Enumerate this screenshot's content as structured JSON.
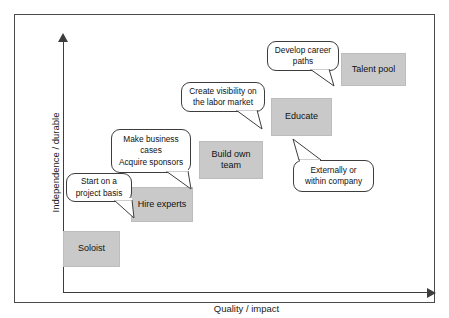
{
  "diagram": {
    "axes": {
      "y_label": "Independence / durable",
      "x_label": "Quality / impact"
    },
    "colors": {
      "box_fill": "#c9c9c9",
      "box_border": "#bdbdbd",
      "line": "#3d3d3d",
      "frame": "#4a4a4a",
      "text": "#111111",
      "background": "#ffffff"
    },
    "stages": [
      {
        "id": "soloist",
        "label": "Soloist"
      },
      {
        "id": "hire-experts",
        "label": "Hire experts"
      },
      {
        "id": "build-own-team",
        "label": "Build own\nteam"
      },
      {
        "id": "educate",
        "label": "Educate"
      },
      {
        "id": "talent-pool",
        "label": "Talent pool"
      }
    ],
    "callouts": [
      {
        "id": "start-on-a-project-basis",
        "label": "Start on a\nproject basis",
        "points_to": "hire-experts"
      },
      {
        "id": "make-business-cases",
        "label": "Make business\ncases\nAcquire sponsors",
        "points_to": "build-own-team"
      },
      {
        "id": "create-visibility",
        "label": "Create visibility on\nthe labor market",
        "points_to": "educate"
      },
      {
        "id": "develop-career-paths",
        "label": "Develop career\npaths",
        "points_to": "talent-pool"
      },
      {
        "id": "externally-or-within-company",
        "label": "Externally or\nwithin company",
        "points_to": "educate"
      }
    ]
  }
}
